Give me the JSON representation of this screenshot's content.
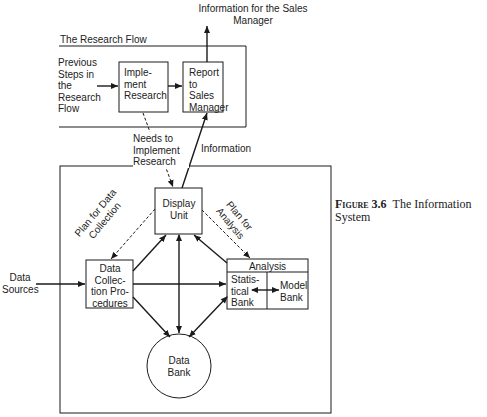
{
  "top_output": "Information for the Sales Manager",
  "research_flow": {
    "title": "The Research Flow",
    "previous_steps": "Previous Steps in the Research Flow",
    "implement_box": "Imple- ment Research",
    "report_box": "Report to Sales Manager"
  },
  "labels": {
    "needs": "Needs to Implement Research",
    "information": "Information",
    "plan_data": "Plan for Data Collection",
    "plan_analysis": "Plan for Analysis",
    "data_sources": "Data Sources"
  },
  "system": {
    "display_unit": "Display Unit",
    "data_collection": "Data Collec- tion Pro- cedures",
    "analysis_header": "Analysis",
    "statistical_bank": "Statis- tical Bank",
    "model_bank": "Model Bank",
    "data_bank": "Data Bank"
  },
  "caption": {
    "figure": "Figure 3.6",
    "title": "The Information System"
  }
}
